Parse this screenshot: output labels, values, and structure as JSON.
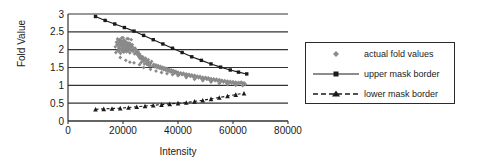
{
  "chart_data": {
    "type": "scatter",
    "title": "",
    "xlabel": "Intensity",
    "ylabel": "Fold Value",
    "xlim": [
      0,
      80000
    ],
    "ylim": [
      0,
      3
    ],
    "grid": "horizontal",
    "legend_position": "right",
    "xticks": [
      "0",
      "20000",
      "40000",
      "60000",
      "80000"
    ],
    "xtick_values": [
      0,
      20000,
      40000,
      60000,
      80000
    ],
    "yticks": [
      "0",
      "0.5",
      "1",
      "1.5",
      "2",
      "2.5",
      "3"
    ],
    "ytick_values": [
      0,
      0.5,
      1,
      1.5,
      2,
      2.5,
      3
    ],
    "series": [
      {
        "name": "actual fold values",
        "type": "scatter",
        "marker": "diamond",
        "color": "#8a8a8a",
        "points": [
          [
            17200,
            2.08
          ],
          [
            17400,
            1.92
          ],
          [
            17600,
            2.21
          ],
          [
            17800,
            2.15
          ],
          [
            18000,
            2.3
          ],
          [
            18050,
            1.98
          ],
          [
            18200,
            2.12
          ],
          [
            18300,
            2.25
          ],
          [
            18400,
            2.05
          ],
          [
            18500,
            1.95
          ],
          [
            18600,
            2.18
          ],
          [
            18700,
            2.28
          ],
          [
            18800,
            2.02
          ],
          [
            18900,
            2.22
          ],
          [
            19000,
            2.1
          ],
          [
            19100,
            1.9
          ],
          [
            19200,
            2.26
          ],
          [
            19300,
            2.14
          ],
          [
            19400,
            2.0
          ],
          [
            19500,
            2.19
          ],
          [
            19600,
            2.08
          ],
          [
            19700,
            2.24
          ],
          [
            19800,
            1.96
          ],
          [
            19900,
            2.12
          ],
          [
            20000,
            2.2
          ],
          [
            20100,
            2.04
          ],
          [
            20200,
            2.16
          ],
          [
            20300,
            1.93
          ],
          [
            20400,
            2.27
          ],
          [
            20500,
            2.09
          ],
          [
            20600,
            2.01
          ],
          [
            20700,
            2.17
          ],
          [
            20800,
            2.23
          ],
          [
            20900,
            1.99
          ],
          [
            21000,
            2.11
          ],
          [
            21100,
            2.06
          ],
          [
            21200,
            2.21
          ],
          [
            21300,
            1.94
          ],
          [
            21400,
            2.13
          ],
          [
            21500,
            2.05
          ],
          [
            21600,
            2.18
          ],
          [
            21700,
            2.0
          ],
          [
            21800,
            2.09
          ],
          [
            21900,
            2.15
          ],
          [
            22000,
            1.97
          ],
          [
            22100,
            2.1
          ],
          [
            22200,
            2.19
          ],
          [
            22300,
            2.03
          ],
          [
            22400,
            2.12
          ],
          [
            22500,
            1.91
          ],
          [
            22600,
            2.07
          ],
          [
            22700,
            2.16
          ],
          [
            22800,
            2.02
          ],
          [
            22900,
            2.11
          ],
          [
            23000,
            1.98
          ],
          [
            23200,
            2.08
          ],
          [
            23400,
            2.14
          ],
          [
            23600,
            1.95
          ],
          [
            23800,
            2.05
          ],
          [
            24000,
            2.0
          ],
          [
            24200,
            1.88
          ],
          [
            24400,
            2.04
          ],
          [
            24600,
            1.92
          ],
          [
            24800,
            1.99
          ],
          [
            25000,
            1.9
          ],
          [
            25200,
            1.96
          ],
          [
            25400,
            1.84
          ],
          [
            25600,
            1.93
          ],
          [
            25800,
            1.8
          ],
          [
            26000,
            1.88
          ],
          [
            26200,
            1.75
          ],
          [
            26400,
            1.83
          ],
          [
            26600,
            1.64
          ],
          [
            26800,
            1.78
          ],
          [
            27000,
            1.72
          ],
          [
            27200,
            1.8
          ],
          [
            27400,
            1.68
          ],
          [
            27600,
            1.74
          ],
          [
            27800,
            1.6
          ],
          [
            28000,
            1.7
          ],
          [
            28200,
            1.76
          ],
          [
            28400,
            1.62
          ],
          [
            28600,
            1.69
          ],
          [
            28800,
            1.58
          ],
          [
            29000,
            1.66
          ],
          [
            29200,
            1.72
          ],
          [
            29400,
            1.57
          ],
          [
            29600,
            1.63
          ],
          [
            29800,
            1.55
          ],
          [
            30000,
            1.61
          ],
          [
            30400,
            1.67
          ],
          [
            30800,
            1.54
          ],
          [
            31200,
            1.59
          ],
          [
            31600,
            1.52
          ],
          [
            32000,
            1.57
          ],
          [
            32400,
            1.5
          ],
          [
            32800,
            1.55
          ],
          [
            33200,
            1.48
          ],
          [
            33600,
            1.53
          ],
          [
            34000,
            1.46
          ],
          [
            34400,
            1.51
          ],
          [
            34800,
            1.44
          ],
          [
            35200,
            1.49
          ],
          [
            35600,
            1.42
          ],
          [
            36000,
            1.47
          ],
          [
            36400,
            1.4
          ],
          [
            36800,
            1.45
          ],
          [
            37200,
            1.38
          ],
          [
            37600,
            1.43
          ],
          [
            38000,
            1.36
          ],
          [
            38400,
            1.41
          ],
          [
            38800,
            1.34
          ],
          [
            39200,
            1.39
          ],
          [
            39600,
            1.33
          ],
          [
            40000,
            1.37
          ],
          [
            40500,
            1.31
          ],
          [
            41000,
            1.35
          ],
          [
            41500,
            1.3
          ],
          [
            42000,
            1.34
          ],
          [
            42500,
            1.28
          ],
          [
            43000,
            1.32
          ],
          [
            43500,
            1.27
          ],
          [
            44000,
            1.31
          ],
          [
            44500,
            1.25
          ],
          [
            45000,
            1.29
          ],
          [
            45500,
            1.24
          ],
          [
            46000,
            1.28
          ],
          [
            46500,
            1.22
          ],
          [
            47000,
            1.26
          ],
          [
            47500,
            1.21
          ],
          [
            48000,
            1.25
          ],
          [
            48500,
            1.19
          ],
          [
            49000,
            1.23
          ],
          [
            49500,
            1.18
          ],
          [
            50000,
            1.22
          ],
          [
            50500,
            1.17
          ],
          [
            51000,
            1.21
          ],
          [
            51500,
            1.15
          ],
          [
            52000,
            1.19
          ],
          [
            52500,
            1.14
          ],
          [
            53000,
            1.18
          ],
          [
            53500,
            1.13
          ],
          [
            54000,
            1.17
          ],
          [
            54500,
            1.12
          ],
          [
            55000,
            1.16
          ],
          [
            55500,
            1.1
          ],
          [
            56000,
            1.14
          ],
          [
            56500,
            1.09
          ],
          [
            57000,
            1.13
          ],
          [
            57500,
            1.08
          ],
          [
            58000,
            1.12
          ],
          [
            58500,
            1.07
          ],
          [
            59000,
            1.11
          ],
          [
            59500,
            1.06
          ],
          [
            60000,
            1.1
          ],
          [
            60500,
            1.05
          ],
          [
            61000,
            1.09
          ],
          [
            61500,
            1.04
          ],
          [
            62000,
            1.08
          ],
          [
            62500,
            1.06
          ],
          [
            63000,
            1.09
          ],
          [
            63500,
            1.05
          ],
          [
            64000,
            1.07
          ],
          [
            64500,
            1.03
          ],
          [
            19000,
            1.78
          ],
          [
            21000,
            1.7
          ],
          [
            22500,
            1.65
          ],
          [
            24000,
            1.63
          ],
          [
            26000,
            1.58
          ],
          [
            27500,
            1.5
          ],
          [
            30000,
            1.45
          ],
          [
            32000,
            1.4
          ],
          [
            34000,
            1.36
          ],
          [
            36000,
            1.33
          ],
          [
            38000,
            1.3
          ],
          [
            40000,
            1.27
          ],
          [
            43000,
            1.22
          ],
          [
            46000,
            1.17
          ],
          [
            49000,
            1.13
          ],
          [
            52000,
            1.09
          ],
          [
            55000,
            1.05
          ],
          [
            58000,
            1.02
          ],
          [
            61000,
            1.0
          ],
          [
            63500,
            0.99
          ],
          [
            20000,
            2.34
          ],
          [
            21500,
            2.31
          ],
          [
            23000,
            2.28
          ],
          [
            19500,
            2.33
          ],
          [
            22000,
            2.3
          ]
        ]
      },
      {
        "name": "upper mask border",
        "type": "line",
        "marker": "square",
        "color": "#1a1a1a",
        "points": [
          [
            10000,
            2.93
          ],
          [
            13500,
            2.82
          ],
          [
            17000,
            2.72
          ],
          [
            20500,
            2.62
          ],
          [
            24000,
            2.52
          ],
          [
            27500,
            2.4
          ],
          [
            31000,
            2.28
          ],
          [
            34500,
            2.16
          ],
          [
            38000,
            2.04
          ],
          [
            41500,
            1.92
          ],
          [
            45000,
            1.8
          ],
          [
            48500,
            1.7
          ],
          [
            52000,
            1.6
          ],
          [
            55500,
            1.51
          ],
          [
            59000,
            1.43
          ],
          [
            62000,
            1.37
          ],
          [
            65000,
            1.32
          ]
        ]
      },
      {
        "name": "lower mask border",
        "type": "line",
        "marker": "triangle",
        "color": "#1a1a1a",
        "linestyle": "dashed",
        "points": [
          [
            10000,
            0.33
          ],
          [
            13000,
            0.34
          ],
          [
            16000,
            0.35
          ],
          [
            19000,
            0.36
          ],
          [
            22000,
            0.38
          ],
          [
            25000,
            0.4
          ],
          [
            28000,
            0.42
          ],
          [
            31000,
            0.44
          ],
          [
            34000,
            0.46
          ],
          [
            37000,
            0.48
          ],
          [
            40000,
            0.5
          ],
          [
            43000,
            0.52
          ],
          [
            46000,
            0.55
          ],
          [
            49000,
            0.58
          ],
          [
            52000,
            0.62
          ],
          [
            55000,
            0.66
          ],
          [
            58000,
            0.7
          ],
          [
            61000,
            0.74
          ],
          [
            64000,
            0.78
          ]
        ]
      }
    ]
  },
  "legend": {
    "entries": [
      {
        "label": "actual fold values",
        "sample": "diamond-marker"
      },
      {
        "label": "upper mask border",
        "sample": "line-square-marker"
      },
      {
        "label": "lower mask border",
        "sample": "dashed-line-triangle-marker"
      }
    ]
  },
  "colors": {
    "scatter": "#8a8a8a",
    "line": "#1a1a1a",
    "grid": "#333333",
    "axis": "#333333",
    "background": "#ffffff"
  }
}
